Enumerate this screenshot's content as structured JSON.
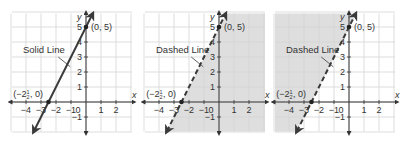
{
  "colors": {
    "grid": "#d4d4d4",
    "axis": "#333333",
    "line": "#3a3a3a",
    "shade": "#dedede",
    "text": "#333333"
  },
  "common": {
    "equation_slope": 2,
    "equation_intercept": 5,
    "x_ticks": [
      -4,
      -3,
      -2,
      -1,
      0,
      1,
      2
    ],
    "x_tick_labels": [
      "−4",
      "−3",
      "−2",
      "−1",
      "0",
      "1",
      "2"
    ],
    "y_ticks": [
      1,
      2,
      3,
      4,
      5,
      -1
    ],
    "y_tick_labels": [
      "1",
      "2",
      "3",
      "4",
      "5",
      "−1"
    ],
    "x_axis_label": "x",
    "y_axis_label": "y",
    "point_a_label": "(0, 5)",
    "point_b_label_prefix": "(−2",
    "point_b_label_num": "1",
    "point_b_label_den": "2",
    "point_b_label_suffix": ", 0)"
  },
  "chart_data": [
    {
      "type": "line",
      "title": "",
      "line_style": "solid",
      "callout": "Solid Line",
      "shaded_region": "none",
      "points": [
        {
          "x": -2.5,
          "y": 0,
          "label": "(−2½, 0)"
        },
        {
          "x": 0,
          "y": 5,
          "label": "(0, 5)"
        }
      ],
      "xlabel": "x",
      "ylabel": "y",
      "xlim": [
        -5,
        3
      ],
      "ylim": [
        -2,
        6
      ],
      "grid": true
    },
    {
      "type": "line",
      "title": "",
      "line_style": "dashed",
      "callout": "Dashed Line",
      "shaded_region": "below-right",
      "points": [
        {
          "x": -2.5,
          "y": 0,
          "label": "(−2½, 0)"
        },
        {
          "x": 0,
          "y": 5,
          "label": "(0, 5)"
        }
      ],
      "xlabel": "x",
      "ylabel": "y",
      "xlim": [
        -5,
        3
      ],
      "ylim": [
        -2,
        6
      ],
      "grid": true
    },
    {
      "type": "line",
      "title": "",
      "line_style": "dashed",
      "callout": "Dashed Line",
      "shaded_region": "above-left",
      "points": [
        {
          "x": -2.5,
          "y": 0,
          "label": "(−2½, 0)"
        },
        {
          "x": 0,
          "y": 5,
          "label": "(0, 5)"
        }
      ],
      "xlabel": "x",
      "ylabel": "y",
      "xlim": [
        -5,
        3
      ],
      "ylim": [
        -2,
        6
      ],
      "grid": true
    }
  ],
  "panels": [
    {
      "ox": 86,
      "oy": 102,
      "callout": "Solid Line"
    },
    {
      "ox": 219,
      "oy": 102,
      "callout": "Dashed Line"
    },
    {
      "ox": 349,
      "oy": 102,
      "callout": "Dashed Line"
    }
  ]
}
